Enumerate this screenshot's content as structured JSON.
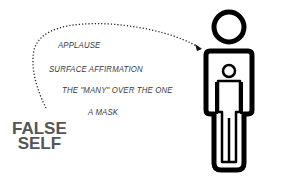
{
  "diagram": {
    "label": [
      "FALSE",
      "SELF"
    ],
    "items": [
      "APPLAUSE",
      "SURFACE AFFIRMATION",
      "THE \"MANY\" OVER THE ONE",
      "A MASK"
    ],
    "colors": {
      "text": "#3a3a3a",
      "label": "#555555",
      "figure": "#000000"
    }
  }
}
